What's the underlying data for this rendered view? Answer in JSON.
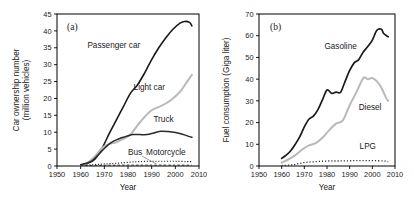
{
  "figure": {
    "panels": [
      "a",
      "b"
    ],
    "background": "#ffffff"
  },
  "panel_a": {
    "tag": "(a)",
    "xlabel": "Year",
    "ylabel_line1": "Car ownership number",
    "ylabel_line2": "(million vehicles)",
    "xticks": [
      "1950",
      "1960",
      "1970",
      "1980",
      "1990",
      "2000",
      "2010"
    ],
    "yticks": [
      "0",
      "5",
      "10",
      "15",
      "20",
      "25",
      "30",
      "35",
      "40",
      "45"
    ],
    "series_labels": [
      "Passenger car",
      "Light car",
      "Truck",
      "Bus",
      "Motorcycle"
    ]
  },
  "panel_b": {
    "tag": "(b)",
    "xlabel": "Year",
    "ylabel": "Fuel consumption (Giga liter)",
    "xticks": [
      "1950",
      "1960",
      "1970",
      "1980",
      "1990",
      "2000",
      "2010"
    ],
    "yticks": [
      "0",
      "10",
      "20",
      "30",
      "40",
      "50",
      "60",
      "70"
    ],
    "series_labels": [
      "Gasoline",
      "Diesel",
      "LPG"
    ]
  },
  "chart_data": [
    {
      "type": "line",
      "id": "panel-a",
      "title": "(a)",
      "xlabel": "Year",
      "ylabel": "Car ownership number (million vehicles)",
      "xlim": [
        1950,
        2010
      ],
      "ylim": [
        0,
        45
      ],
      "xticks": [
        1950,
        1960,
        1970,
        1980,
        1990,
        2000,
        2010
      ],
      "yticks": [
        0,
        5,
        10,
        15,
        20,
        25,
        30,
        35,
        40,
        45
      ],
      "grid": false,
      "legend": "inline-annotations",
      "series": [
        {
          "name": "Passenger car",
          "color": "#1a1a1a",
          "style": "solid",
          "width": 1.6,
          "x": [
            1960,
            1963,
            1966,
            1969,
            1972,
            1975,
            1978,
            1981,
            1984,
            1987,
            1990,
            1993,
            1996,
            1999,
            2002,
            2004,
            2006,
            2007
          ],
          "y": [
            0.3,
            0.8,
            2.0,
            5.2,
            9.5,
            13.5,
            17.5,
            21.5,
            24.0,
            27.5,
            31.5,
            35.0,
            38.0,
            40.5,
            42.3,
            42.8,
            42.5,
            41.5
          ]
        },
        {
          "name": "Light car",
          "color": "#b9b9b9",
          "style": "solid",
          "width": 2.0,
          "x": [
            1960,
            1963,
            1966,
            1969,
            1972,
            1975,
            1978,
            1981,
            1984,
            1987,
            1990,
            1993,
            1996,
            1999,
            2002,
            2005,
            2007
          ],
          "y": [
            0.2,
            1.0,
            2.8,
            5.3,
            6.5,
            7.0,
            8.0,
            9.3,
            12.0,
            14.5,
            16.5,
            17.5,
            18.5,
            20.0,
            22.0,
            25.0,
            27.0
          ]
        },
        {
          "name": "Truck",
          "color": "#2a2a2a",
          "style": "solid",
          "width": 1.5,
          "x": [
            1960,
            1964,
            1967,
            1970,
            1973,
            1976,
            1979,
            1982,
            1985,
            1988,
            1991,
            1994,
            1997,
            2000,
            2003,
            2006,
            2007
          ],
          "y": [
            0.4,
            1.2,
            3.0,
            5.2,
            7.0,
            8.0,
            8.7,
            9.3,
            9.3,
            9.3,
            9.8,
            10.3,
            10.2,
            9.9,
            9.4,
            8.7,
            8.5
          ]
        },
        {
          "name": "Bus",
          "color": "#2a2a2a",
          "style": "dashed",
          "width": 1.0,
          "x": [
            1960,
            1970,
            1980,
            1990,
            2000,
            2007
          ],
          "y": [
            0.1,
            0.2,
            0.25,
            0.25,
            0.25,
            0.23
          ]
        },
        {
          "name": "Motorcycle",
          "color": "#2a2a2a",
          "style": "dotted",
          "width": 1.2,
          "x": [
            1960,
            1965,
            1970,
            1975,
            1980,
            1985,
            1990,
            1995,
            2000,
            2005,
            2007
          ],
          "y": [
            0.2,
            0.4,
            0.6,
            0.8,
            1.1,
            1.3,
            1.4,
            1.4,
            1.4,
            1.3,
            1.3
          ]
        }
      ],
      "annotations": [
        {
          "text": "Passenger car",
          "x": 1974,
          "y": 35.0
        },
        {
          "text": "Light car",
          "x": 1989,
          "y": 22.5
        },
        {
          "text": "Truck",
          "x": 1995,
          "y": 13.0
        },
        {
          "text": "Bus",
          "x": 1983,
          "y": 3.4
        },
        {
          "text": "Motorcycle",
          "x": 1996,
          "y": 3.4
        }
      ]
    },
    {
      "type": "line",
      "id": "panel-b",
      "title": "(b)",
      "xlabel": "Year",
      "ylabel": "Fuel consumption (Giga liter)",
      "xlim": [
        1950,
        2010
      ],
      "ylim": [
        0,
        70
      ],
      "xticks": [
        1950,
        1960,
        1970,
        1980,
        1990,
        2000,
        2010
      ],
      "yticks": [
        0,
        10,
        20,
        30,
        40,
        50,
        60,
        70
      ],
      "grid": false,
      "legend": "inline-annotations",
      "series": [
        {
          "name": "Gasoline",
          "color": "#1a1a1a",
          "style": "solid",
          "width": 1.7,
          "x": [
            1960,
            1962,
            1964,
            1966,
            1968,
            1970,
            1972,
            1974,
            1976,
            1978,
            1980,
            1982,
            1984,
            1986,
            1988,
            1990,
            1992,
            1994,
            1996,
            1998,
            2000,
            2002,
            2004,
            2005,
            2007
          ],
          "y": [
            3.5,
            5.0,
            7.0,
            10.0,
            13.5,
            18.0,
            21.5,
            23.0,
            26.0,
            30.5,
            35.0,
            33.5,
            34.0,
            34.0,
            39.0,
            44.0,
            47.5,
            49.0,
            52.5,
            55.0,
            58.0,
            62.5,
            63.0,
            61.0,
            59.5
          ]
        },
        {
          "name": "Diesel",
          "color": "#b9b9b9",
          "style": "solid",
          "width": 2.0,
          "x": [
            1960,
            1963,
            1966,
            1969,
            1972,
            1975,
            1978,
            1981,
            1984,
            1987,
            1990,
            1993,
            1996,
            1998,
            2000,
            2002,
            2004,
            2006,
            2007
          ],
          "y": [
            1.5,
            3.0,
            5.0,
            7.5,
            9.5,
            10.5,
            13.0,
            16.5,
            19.5,
            21.0,
            28.0,
            34.0,
            40.5,
            40.0,
            40.5,
            39.0,
            36.0,
            31.5,
            30.0
          ]
        },
        {
          "name": "LPG",
          "color": "#2a2a2a",
          "style": "dotted",
          "width": 1.3,
          "x": [
            1960,
            1965,
            1970,
            1975,
            1980,
            1985,
            1990,
            1995,
            2000,
            2005,
            2007
          ],
          "y": [
            0.2,
            0.6,
            1.6,
            2.0,
            2.3,
            2.3,
            2.4,
            2.5,
            2.5,
            2.3,
            2.0
          ]
        }
      ],
      "annotations": [
        {
          "text": "Gasoline",
          "x": 1986,
          "y": 54.0
        },
        {
          "text": "Diesel",
          "x": 1999,
          "y": 26.0
        },
        {
          "text": "LPG",
          "x": 1998,
          "y": 8.0
        }
      ]
    }
  ]
}
